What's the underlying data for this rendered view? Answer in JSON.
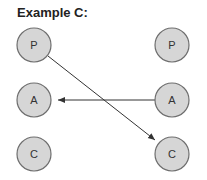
{
  "title": "Example C:",
  "left_column": [
    {
      "label": "P"
    },
    {
      "label": "A"
    },
    {
      "label": "C"
    }
  ],
  "right_column": [
    {
      "label": "P"
    },
    {
      "label": "A"
    },
    {
      "label": "C"
    }
  ],
  "edges": [
    {
      "from": "left.P",
      "to": "right.C",
      "directed": true
    },
    {
      "from": "right.A",
      "to": "left.A",
      "directed": true
    }
  ],
  "colors": {
    "node_fill": "#d6d6d6",
    "node_stroke": "#6e6e6e",
    "edge": "#333333"
  }
}
